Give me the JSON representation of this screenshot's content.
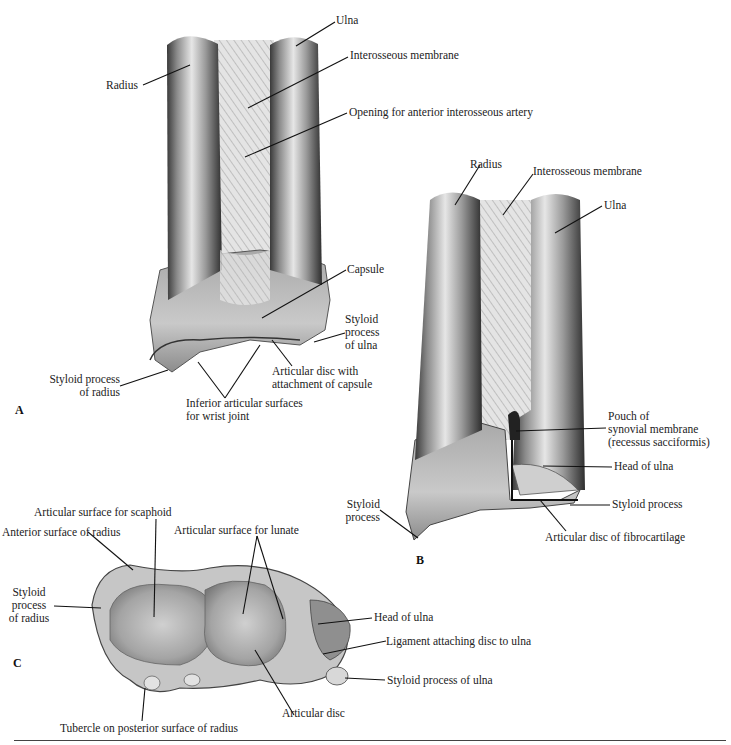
{
  "figure": {
    "panels": [
      {
        "letter": "A",
        "labels": {
          "ulna": "Ulna",
          "interosseous_membrane": "Interosseous membrane",
          "opening_artery": "Opening for anterior interosseous artery",
          "radius": "Radius",
          "capsule": "Capsule",
          "styloid_ulna": [
            "Styloid",
            "process",
            "of ulna"
          ],
          "articular_disc_capsule": [
            "Articular disc with",
            "attachment of capsule"
          ],
          "styloid_radius": [
            "Styloid process",
            "of radius"
          ],
          "inferior_articular": [
            "Inferior articular surfaces",
            "for wrist joint"
          ]
        }
      },
      {
        "letter": "B",
        "labels": {
          "radius": "Radius",
          "interosseous_membrane": "Interosseous membrane",
          "ulna": "Ulna",
          "pouch": [
            "Pouch of",
            "synovial membrane",
            "(recessus sacciformis)"
          ],
          "head_of_ulna": "Head of ulna",
          "styloid_process_ulna": "Styloid process",
          "styloid_process_radius": [
            "Styloid",
            "process"
          ],
          "articular_disc_fibro": "Articular disc of fibrocartilage"
        }
      },
      {
        "letter": "C",
        "labels": {
          "scaphoid": "Articular surface for scaphoid",
          "anterior_surface": "Anterior surface of radius",
          "lunate": "Articular surface for lunate",
          "styloid_radius": [
            "Styloid",
            "process",
            "of radius"
          ],
          "head_of_ulna": "Head of ulna",
          "ligament": "Ligament attaching disc to ulna",
          "styloid_ulna": "Styloid process of ulna",
          "articular_disc": "Articular disc",
          "tubercle": "Tubercle on posterior surface of radius"
        }
      }
    ]
  }
}
